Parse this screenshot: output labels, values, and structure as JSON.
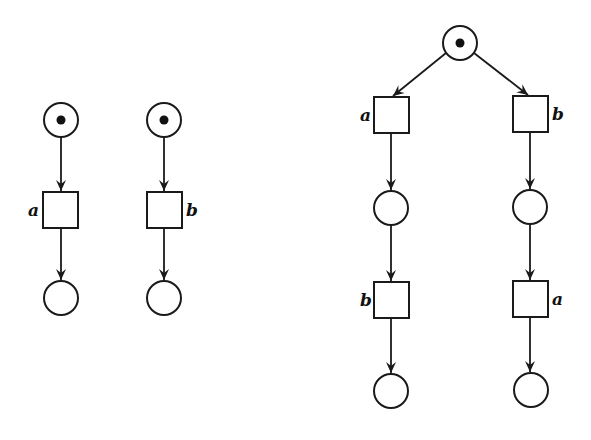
{
  "diagram": {
    "type": "petri-net",
    "nets": [
      {
        "id": "net-left-a",
        "places": [
          {
            "id": "p1",
            "token": true
          },
          {
            "id": "p2",
            "token": false
          }
        ],
        "transitions": [
          {
            "id": "t1",
            "label": "a"
          }
        ],
        "arcs": [
          [
            "p1",
            "t1"
          ],
          [
            "t1",
            "p2"
          ]
        ]
      },
      {
        "id": "net-left-b",
        "places": [
          {
            "id": "p1",
            "token": true
          },
          {
            "id": "p2",
            "token": false
          }
        ],
        "transitions": [
          {
            "id": "t1",
            "label": "b"
          }
        ],
        "arcs": [
          [
            "p1",
            "t1"
          ],
          [
            "t1",
            "p2"
          ]
        ]
      },
      {
        "id": "net-right-tree",
        "places": [
          {
            "id": "p0",
            "token": true
          },
          {
            "id": "pL1",
            "token": false
          },
          {
            "id": "pL2",
            "token": false
          },
          {
            "id": "pR1",
            "token": false
          },
          {
            "id": "pR2",
            "token": false
          }
        ],
        "transitions": [
          {
            "id": "tL1",
            "label": "a"
          },
          {
            "id": "tL2",
            "label": "b"
          },
          {
            "id": "tR1",
            "label": "b"
          },
          {
            "id": "tR2",
            "label": "a"
          }
        ],
        "arcs": [
          [
            "p0",
            "tL1"
          ],
          [
            "tL1",
            "pL1"
          ],
          [
            "pL1",
            "tL2"
          ],
          [
            "tL2",
            "pL2"
          ],
          [
            "p0",
            "tR1"
          ],
          [
            "tR1",
            "pR1"
          ],
          [
            "pR1",
            "tR2"
          ],
          [
            "tR2",
            "pR2"
          ]
        ]
      }
    ]
  },
  "labels": {
    "left_a": "a",
    "left_b": "b",
    "right_l1": "a",
    "right_l2": "b",
    "right_r1": "b",
    "right_r2": "a"
  }
}
